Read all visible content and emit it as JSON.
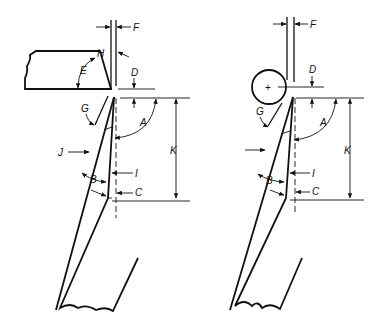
{
  "diagram": {
    "left": {
      "name": "tool-with-flat-workpiece",
      "labels": {
        "F": "F",
        "H": "H",
        "E": "E",
        "D": "D",
        "G": "G",
        "A": "A",
        "J": "J",
        "K": "K",
        "I": "I",
        "B": "B",
        "C": "C"
      }
    },
    "right": {
      "name": "tool-with-round-workpiece",
      "labels": {
        "F": "F",
        "D": "D",
        "G": "G",
        "A": "A",
        "K": "K",
        "I": "I",
        "B": "B",
        "C": "C",
        "plus": "+"
      }
    }
  }
}
